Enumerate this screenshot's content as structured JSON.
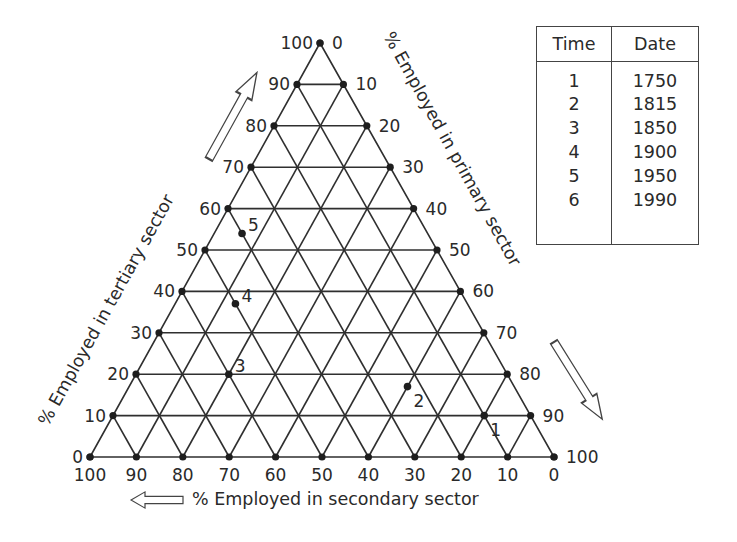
{
  "chart_data": {
    "type": "ternary",
    "title": "",
    "axes": {
      "tertiary": {
        "label": "% Employed in tertiary sector",
        "ticks": [
          0,
          10,
          20,
          30,
          40,
          50,
          60,
          70,
          80,
          90,
          100
        ],
        "position": "left edge, 0 at bottom-left to 100 at top"
      },
      "primary": {
        "label": "% Employed in primary sector",
        "ticks": [
          0,
          10,
          20,
          30,
          40,
          50,
          60,
          70,
          80,
          90,
          100
        ],
        "position": "right edge, 0 at top to 100 at bottom-right"
      },
      "secondary": {
        "label": "% Employed in secondary sector",
        "ticks": [
          100,
          90,
          80,
          70,
          60,
          50,
          40,
          30,
          20,
          10,
          0
        ],
        "position": "bottom edge, 100 at bottom-left to 0 at bottom-right"
      }
    },
    "grid": true,
    "grid_step": 10,
    "points": [
      {
        "label": "1",
        "primary": 80,
        "secondary": 10,
        "tertiary": 10
      },
      {
        "label": "2",
        "primary": 60,
        "secondary": 23,
        "tertiary": 17
      },
      {
        "label": "3",
        "primary": 20,
        "secondary": 60,
        "tertiary": 20
      },
      {
        "label": "4",
        "primary": 13,
        "secondary": 50,
        "tertiary": 37
      },
      {
        "label": "5",
        "primary": 6,
        "secondary": 40,
        "tertiary": 54
      }
    ],
    "legend_table": {
      "headers": [
        "Time",
        "Date"
      ],
      "rows": [
        [
          "1",
          "1750"
        ],
        [
          "2",
          "1815"
        ],
        [
          "3",
          "1850"
        ],
        [
          "4",
          "1900"
        ],
        [
          "5",
          "1950"
        ],
        [
          "6",
          "1990"
        ]
      ]
    }
  },
  "labels": {
    "tertiary_axis": "% Employed in tertiary sector",
    "primary_axis": "% Employed in primary sector",
    "secondary_axis": "% Employed in secondary sector"
  },
  "table": {
    "header_time": "Time",
    "header_date": "Date",
    "rows": [
      {
        "time": "1",
        "date": "1750"
      },
      {
        "time": "2",
        "date": "1815"
      },
      {
        "time": "3",
        "date": "1850"
      },
      {
        "time": "4",
        "date": "1900"
      },
      {
        "time": "5",
        "date": "1950"
      },
      {
        "time": "6",
        "date": "1990"
      }
    ]
  }
}
